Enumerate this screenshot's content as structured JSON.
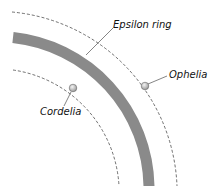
{
  "diagram": {
    "labels": {
      "ring": "Epsilon ring",
      "moon_outer": "Ophelia",
      "moon_inner": "Cordelia"
    },
    "colors": {
      "ring": "#8a8a8a",
      "orbit": "#333333",
      "moon": "#c8c8c8"
    }
  }
}
